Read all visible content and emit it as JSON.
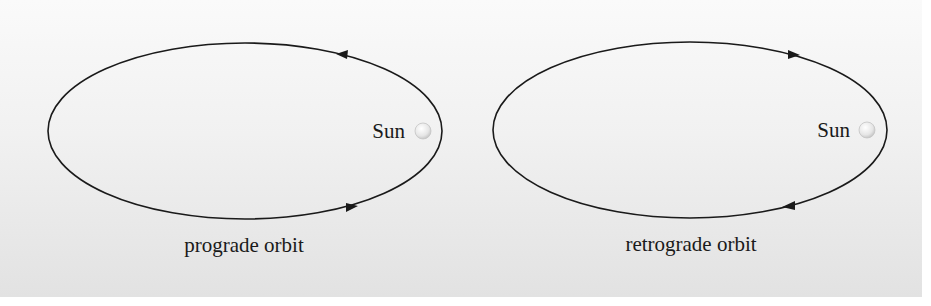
{
  "diagrams": [
    {
      "id": "prograde",
      "caption": "prograde orbit",
      "sun_label": "Sun",
      "direction": "counterclockwise",
      "ellipse": {
        "cx": 245,
        "cy": 131,
        "rx": 197,
        "ry": 88
      },
      "sun": {
        "x": 423,
        "y": 131,
        "r": 8
      },
      "arrows": [
        {
          "position": "top-right",
          "x": 345,
          "y": 55,
          "pointing": "left"
        },
        {
          "position": "bottom-right",
          "x": 350,
          "y": 207,
          "pointing": "right"
        }
      ]
    },
    {
      "id": "retrograde",
      "caption": "retrograde orbit",
      "sun_label": "Sun",
      "direction": "clockwise",
      "ellipse": {
        "cx": 690,
        "cy": 130,
        "rx": 197,
        "ry": 88
      },
      "sun": {
        "x": 867,
        "y": 130,
        "r": 8
      },
      "arrows": [
        {
          "position": "top-right",
          "x": 795,
          "y": 53,
          "pointing": "right"
        },
        {
          "position": "bottom-right",
          "x": 790,
          "y": 206,
          "pointing": "left"
        }
      ]
    }
  ],
  "colors": {
    "line": "#1a1a1a",
    "sun_fill": "#e8e8e8",
    "sun_stroke": "#bdbdbd"
  }
}
